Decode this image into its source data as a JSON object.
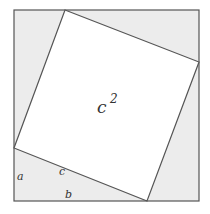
{
  "diagram": {
    "center_label": "c",
    "center_exponent": "2",
    "labels": {
      "a": "a",
      "b": "b",
      "c": "c"
    },
    "colors": {
      "background": "#ffffff",
      "triangle_fill": "#ececec",
      "inner_square_fill": "#ffffff",
      "stroke": "#555555",
      "text": "#333333"
    }
  }
}
